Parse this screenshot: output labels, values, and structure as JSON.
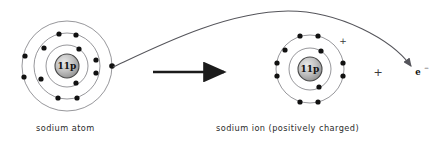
{
  "figure": {
    "type": "diagram",
    "background_color": "#ffffff",
    "width": 438,
    "height": 143
  },
  "atom": {
    "caption": "sodium atom",
    "nucleus_label": "11p",
    "center": {
      "x": 67,
      "y": 66
    },
    "nucleus_radius": 12,
    "shells": [
      {
        "name": "inner-shell",
        "radius": 21,
        "electron_count": 2
      },
      {
        "name": "middle-shell",
        "radius": 33,
        "electron_count": 8
      },
      {
        "name": "outer-shell",
        "radius": 45,
        "electron_count": 1
      }
    ],
    "electrons": [
      {
        "shell": 0,
        "x": 79,
        "y": 49
      },
      {
        "shell": 0,
        "x": 76,
        "y": 83
      },
      {
        "shell": 1,
        "x": 59,
        "y": 34
      },
      {
        "shell": 1,
        "x": 76,
        "y": 35
      },
      {
        "shell": 1,
        "x": 44,
        "y": 48
      },
      {
        "shell": 1,
        "x": 96,
        "y": 60
      },
      {
        "shell": 1,
        "x": 96,
        "y": 73
      },
      {
        "shell": 1,
        "x": 41,
        "y": 79
      },
      {
        "shell": 1,
        "x": 58,
        "y": 98
      },
      {
        "shell": 1,
        "x": 77,
        "y": 98
      },
      {
        "shell": 2,
        "x": 25,
        "y": 56
      },
      {
        "shell": 2,
        "x": 24,
        "y": 77
      },
      {
        "shell": 2,
        "x": 112,
        "y": 66
      }
    ]
  },
  "ion": {
    "caption": "sodium ion (positively charged)",
    "nucleus_label": "11p",
    "charge_symbol": "+",
    "charge_position": {
      "x": 343,
      "y": 41
    },
    "center": {
      "x": 310,
      "y": 69
    },
    "nucleus_radius": 12,
    "shells": [
      {
        "name": "inner-shell",
        "radius": 21,
        "electron_count": 2
      },
      {
        "name": "outer-shell",
        "radius": 34,
        "electron_count": 8
      }
    ],
    "electrons": [
      {
        "shell": 0,
        "x": 321,
        "y": 51
      },
      {
        "shell": 0,
        "x": 319,
        "y": 87
      },
      {
        "shell": 1,
        "x": 300,
        "y": 36
      },
      {
        "shell": 1,
        "x": 318,
        "y": 36
      },
      {
        "shell": 1,
        "x": 285,
        "y": 50
      },
      {
        "shell": 1,
        "x": 277,
        "y": 63
      },
      {
        "shell": 1,
        "x": 277,
        "y": 76
      },
      {
        "shell": 1,
        "x": 343,
        "y": 63
      },
      {
        "shell": 1,
        "x": 343,
        "y": 76
      },
      {
        "shell": 1,
        "x": 300,
        "y": 102
      },
      {
        "shell": 1,
        "x": 318,
        "y": 102
      }
    ]
  },
  "reaction_arrow": {
    "name": "reaction-arrow",
    "from": {
      "x": 153,
      "y": 72
    },
    "to": {
      "x": 226,
      "y": 72
    }
  },
  "electron_path": {
    "name": "electron-transfer-curve",
    "start": {
      "x": 113,
      "y": 67
    },
    "apex": {
      "x": 288,
      "y": 11
    },
    "end": {
      "x": 414,
      "y": 68
    }
  },
  "free_electron": {
    "label": "e",
    "superscript": "−",
    "position": {
      "x": 420,
      "y": 72
    }
  },
  "plus_operator": {
    "label": "+",
    "position": {
      "x": 378,
      "y": 72
    }
  },
  "colors": {
    "stroke": "#55555b",
    "electron": "#111111",
    "text": "#2b2b2b",
    "nucleus_fill": "#b8b8b8",
    "arrow": "#1b1b1b"
  }
}
